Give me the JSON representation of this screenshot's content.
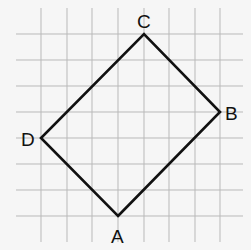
{
  "diagram": {
    "type": "quadrilateral-on-grid",
    "grid": {
      "columns_x": [
        41,
        67,
        92,
        118,
        144,
        169,
        195,
        220
      ],
      "rows_y": [
        34,
        60,
        86,
        112,
        138,
        164,
        190,
        216
      ],
      "v_extent": [
        8,
        242
      ],
      "h_extent": [
        16,
        243
      ],
      "color": "#b9b9b9"
    },
    "stroke_color": "#111111",
    "vertices": [
      {
        "name": "A",
        "label": "A",
        "grid": [
          3,
          7
        ],
        "x": 118,
        "y": 216,
        "label_x": 111,
        "label_y": 243
      },
      {
        "name": "B",
        "label": "B",
        "grid": [
          7,
          3
        ],
        "x": 220,
        "y": 112,
        "label_x": 225,
        "label_y": 120
      },
      {
        "name": "C",
        "label": "C",
        "grid": [
          4,
          0
        ],
        "x": 144,
        "y": 34,
        "label_x": 137,
        "label_y": 28
      },
      {
        "name": "D",
        "label": "D",
        "grid": [
          0,
          4
        ],
        "x": 41,
        "y": 138,
        "label_x": 21,
        "label_y": 146
      }
    ],
    "path_order": [
      "A",
      "B",
      "C",
      "D"
    ]
  }
}
